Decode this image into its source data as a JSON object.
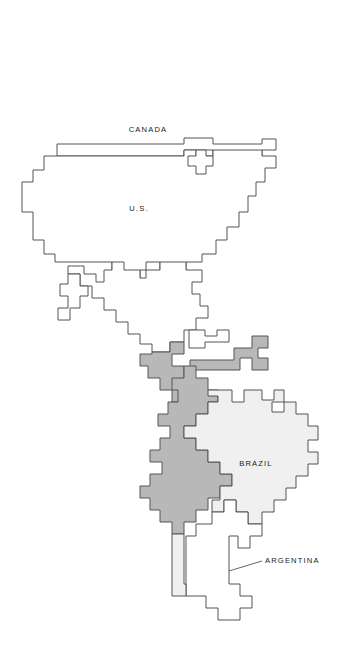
{
  "figure": {
    "kind": "thematic-map",
    "region": "Americas",
    "background_color": "#ffffff",
    "outline_color": "#555555"
  },
  "legend_fills": {
    "unshaded_land": "#ffffff",
    "highlight_land": "#b8b8b8",
    "brazil_land": "#f0f0f0"
  },
  "labels": [
    {
      "id": "canada",
      "text": "CANADA",
      "x": 148,
      "y": 130,
      "align": "middle"
    },
    {
      "id": "us",
      "text": "U.S.",
      "x": 139,
      "y": 209,
      "align": "middle"
    },
    {
      "id": "brazil",
      "text": "BRAZIL",
      "x": 256,
      "y": 464,
      "align": "middle"
    },
    {
      "id": "argentina",
      "text": "ARGENTINA",
      "x": 265,
      "y": 561,
      "align": "left"
    }
  ],
  "leader": {
    "id": "argentina-leader",
    "from_x": 229,
    "from_y": 571,
    "to_x": 262,
    "to_y": 561
  },
  "shapes": {
    "canada": "M 57 144 L 184 144 L 184 138 L 213 138 L 213 144 L 262 144 L 262 139 L 276 139 L 276 150 L 262 150 L 262 156 L 213 156 L 213 150 L 184 150 L 184 156 L 57 156 Z",
    "united_states": "M 44 156 L 184 156 L 184 150 L 196 150 L 196 156 L 213 156 L 213 150 L 262 150 L 262 156 L 276 156 L 276 168 L 265 168 L 265 182 L 256 182 L 256 196 L 248 196 L 248 212 L 239 212 L 239 227 L 227 227 L 227 240 L 216 240 L 216 254 L 202 254 L 202 262 L 186 262 L 186 270 L 160 270 L 160 262 L 146 262 L 146 270 L 140 270 L 140 278 L 124 278 L 124 270 L 112 270 L 112 262 L 55 262 L 55 254 L 44 254 L 44 240 L 33 240 L 33 212 L 22 212 L 22 182 L 33 182 L 33 170 L 44 170 Z",
    "great_lakes": "M 196 150 L 206 150 L 206 156 L 213 156 L 213 166 L 206 166 L 206 174 L 196 174 L 196 166 L 188 166 L 188 156 L 196 156 Z",
    "mexico": "M 112 262 L 124 262 L 124 270 L 140 270 L 140 278 L 146 278 L 146 270 L 160 270 L 160 262 L 186 262 L 186 270 L 202 270 L 202 282 L 192 282 L 192 294 L 200 294 L 200 306 L 208 306 L 208 318 L 196 318 L 196 330 L 184 330 L 184 342 L 170 342 L 170 352 L 152 352 L 152 344 L 140 344 L 140 334 L 128 334 L 128 322 L 116 322 L 116 310 L 104 310 L 104 298 L 92 298 L 92 286 L 80 286 L 80 274 L 68 274 L 68 266 L 84 266 L 84 274 L 96 274 L 96 282 L 104 282 L 104 270 L 112 270 Z",
    "baja": "M 68 274 L 80 274 L 80 286 L 88 286 L 88 296 L 80 296 L 80 308 L 70 308 L 70 320 L 58 320 L 58 308 L 68 308 L 68 296 L 60 296 L 60 284 L 68 284 Z",
    "central_america": "M 152 352 L 170 352 L 170 342 L 184 342 L 184 354 L 172 354 L 172 366 L 184 366 L 184 378 L 196 378 L 196 390 L 184 390 L 184 402 L 172 402 L 172 390 L 160 390 L 160 378 L 148 378 L 148 366 L 140 366 L 140 354 L 152 354 Z",
    "cuba": "M 189 330 L 205 330 L 205 336 L 217 336 L 217 330 L 229 330 L 229 342 L 205 342 L 205 348 L 189 348 Z",
    "venezuela_north": "M 190 360 L 234 360 L 234 348 L 252 348 L 252 336 L 268 336 L 268 348 L 258 348 L 258 358 L 268 358 L 268 370 L 252 370 L 252 358 L 240 358 L 240 370 L 190 370 Z",
    "colombia_peru_chile": "M 184 366 L 196 366 L 196 378 L 208 378 L 208 390 L 218 390 L 218 402 L 208 402 L 208 414 L 196 414 L 196 426 L 184 426 L 184 438 L 196 438 L 196 450 L 208 450 L 208 462 L 220 462 L 220 474 L 232 474 L 232 486 L 220 486 L 220 498 L 208 498 L 208 510 L 196 510 L 196 522 L 184 522 L 184 534 L 172 534 L 172 522 L 160 522 L 160 510 L 150 510 L 150 498 L 140 498 L 140 486 L 150 486 L 150 474 L 162 474 L 162 462 L 150 462 L 150 450 L 160 450 L 160 438 L 170 438 L 170 426 L 158 426 L 158 414 L 168 414 L 168 402 L 178 402 L 178 390 L 172 390 L 172 378 L 184 378 Z",
    "brazil": "M 208 390 L 232 390 L 232 402 L 244 402 L 244 390 L 262 390 L 262 400 L 274 400 L 274 390 L 284 390 L 284 402 L 272 402 L 272 412 L 284 412 L 284 402 L 296 402 L 296 414 L 308 414 L 308 426 L 318 426 L 318 440 L 308 440 L 308 452 L 318 452 L 318 464 L 308 464 L 308 476 L 296 476 L 296 488 L 286 488 L 286 500 L 274 500 L 274 512 L 262 512 L 262 524 L 248 524 L 248 512 L 236 512 L 236 500 L 224 500 L 224 512 L 212 512 L 212 500 L 220 500 L 220 486 L 232 486 L 232 474 L 220 474 L 220 462 L 208 462 L 208 450 L 196 450 L 196 438 L 184 438 L 184 426 L 196 426 L 196 414 L 208 414 L 208 402 L 218 402 L 218 396 L 208 396 Z",
    "southern_cone": "M 212 512 L 224 512 L 224 500 L 236 500 L 236 512 L 248 512 L 248 524 L 262 524 L 262 536 L 250 536 L 250 548 L 238 548 L 238 536 L 229 536 L 229 548 L 229 560 L 229 584 L 240 584 L 240 596 L 252 596 L 252 608 L 240 608 L 240 620 L 218 620 L 218 608 L 206 608 L 206 596 L 186 596 L 186 584 L 186 560 L 186 536 L 196 536 L 196 524 L 212 524 Z",
    "chile_strip": "M 172 534 L 184 534 L 184 546 L 184 560 L 184 584 L 186 584 L 186 596 L 172 596 L 172 584 L 172 560 L 172 546 Z"
  }
}
